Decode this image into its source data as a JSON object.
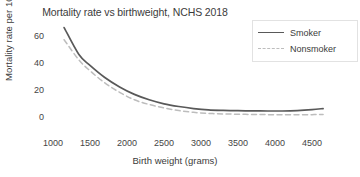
{
  "chart_data": {
    "type": "line",
    "title": "Mortality rate vs birthweight, NCHS 2018",
    "xlabel": "Birth weight (grams)",
    "ylabel": "Mortality rate per 1000",
    "xlim": [
      1000,
      4700
    ],
    "ylim": [
      0,
      70
    ],
    "xticks": [
      1000,
      1500,
      2000,
      2500,
      3000,
      3500,
      4000,
      4500
    ],
    "yticks": [
      0,
      20,
      40,
      60
    ],
    "grid": false,
    "legend_position": "top-right",
    "series": [
      {
        "name": "Smoker",
        "style": "solid",
        "color": "#595959",
        "x": [
          1150,
          1350,
          1500,
          1700,
          1900,
          2100,
          2300,
          2500,
          2700,
          2900,
          3100,
          3300,
          3500,
          3700,
          3900,
          4100,
          4300,
          4500,
          4650
        ],
        "y": [
          67,
          47,
          39,
          30,
          23,
          17.5,
          13.5,
          10.5,
          8.5,
          7,
          6,
          5.6,
          5.4,
          5.3,
          5.2,
          5.2,
          5.5,
          6.2,
          7
        ]
      },
      {
        "name": "Nonsmoker",
        "style": "dashed",
        "color": "#bdbdbd",
        "x": [
          1150,
          1350,
          1500,
          1700,
          1900,
          2100,
          2300,
          2500,
          2700,
          2900,
          3100,
          3300,
          3500,
          3700,
          3900,
          4100,
          4300,
          4500,
          4650
        ],
        "y": [
          58,
          43,
          35,
          26,
          19,
          13.5,
          10,
          7.5,
          5.5,
          4.2,
          3.4,
          3,
          2.8,
          2.6,
          2.5,
          2.4,
          2.4,
          2.5,
          2.6
        ]
      }
    ]
  },
  "legend": {
    "items": [
      {
        "label": "Smoker"
      },
      {
        "label": "Nonsmoker"
      }
    ]
  }
}
